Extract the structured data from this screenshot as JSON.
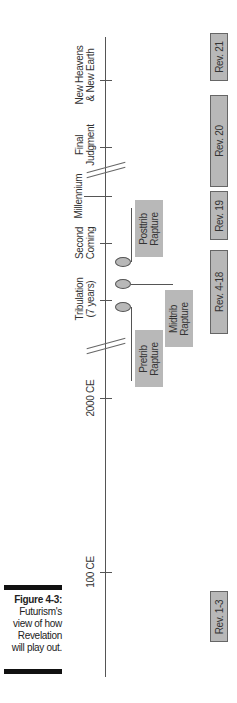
{
  "figure": {
    "title": "Figure 4-3:",
    "caption_lines": [
      "Futurism's",
      "view of how",
      "Revelation",
      "will play out."
    ]
  },
  "timeline": {
    "events": [
      {
        "id": "new-heavens",
        "lines": [
          "New Heavens",
          "& New Earth"
        ]
      },
      {
        "id": "final-judgment",
        "lines": [
          "Final",
          "Judgment"
        ]
      },
      {
        "id": "millennium",
        "lines": [
          "Millennium"
        ]
      },
      {
        "id": "second-coming",
        "lines": [
          "Second",
          "Coming"
        ]
      },
      {
        "id": "tribulation",
        "lines": [
          "Tribulation",
          "(7 years)"
        ]
      },
      {
        "id": "2000-ce",
        "lines": [
          "2000 CE"
        ]
      },
      {
        "id": "100-ce",
        "lines": [
          "100 CE"
        ]
      }
    ]
  },
  "raptures": [
    {
      "id": "pretrib",
      "lines": [
        "Pretrib",
        "Rapture"
      ]
    },
    {
      "id": "midtrib",
      "lines": [
        "Midtrib",
        "Rapture"
      ]
    },
    {
      "id": "posttrib",
      "lines": [
        "Posttrib",
        "Rapture"
      ]
    }
  ],
  "revelation_chapters": [
    {
      "id": "rev-21",
      "label": "Rev. 21"
    },
    {
      "id": "rev-20",
      "label": "Rev. 20"
    },
    {
      "id": "rev-19",
      "label": "Rev. 19"
    },
    {
      "id": "rev-4-18",
      "label": "Rev. 4-18"
    },
    {
      "id": "rev-1-3",
      "label": "Rev. 1-3"
    }
  ],
  "colors": {
    "box_fill": "#b8b8b8",
    "line": "#555555",
    "caption_bar": "#111111"
  }
}
